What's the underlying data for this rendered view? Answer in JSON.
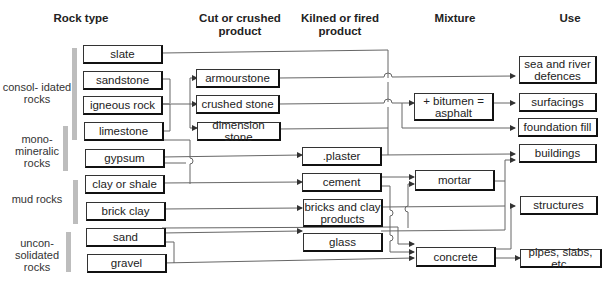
{
  "headers": {
    "rock_type": "Rock type",
    "cut_crushed": "Cut or crushed product",
    "kilned_fired": "Kilned or fired product",
    "mixture": "Mixture",
    "use": "Use"
  },
  "groups": [
    {
      "id": "consolidated",
      "label": "consol- idated rocks"
    },
    {
      "id": "monomineralic",
      "label": "mono- mineralic rocks"
    },
    {
      "id": "mud",
      "label": "mud rocks"
    },
    {
      "id": "unconsolidated",
      "label": "uncon- solidated rocks"
    }
  ],
  "rock_types": [
    {
      "id": "slate",
      "label": "slate"
    },
    {
      "id": "sandstone",
      "label": "sandstone"
    },
    {
      "id": "igneous",
      "label": "igneous rock"
    },
    {
      "id": "limestone",
      "label": "limestone"
    },
    {
      "id": "gypsum",
      "label": "gypsum"
    },
    {
      "id": "clay_shale",
      "label": "clay or shale"
    },
    {
      "id": "brick_clay",
      "label": "brick clay"
    },
    {
      "id": "sand",
      "label": "sand"
    },
    {
      "id": "gravel",
      "label": "gravel"
    }
  ],
  "cut_crushed_products": [
    {
      "id": "armourstone",
      "label": "armourstone"
    },
    {
      "id": "crushed_stone",
      "label": "crushed stone"
    },
    {
      "id": "dimension_stone",
      "label": "dimension stone"
    }
  ],
  "kilned_products": [
    {
      "id": "plaster",
      "label": ".plaster"
    },
    {
      "id": "cement",
      "label": "cement"
    },
    {
      "id": "bricks",
      "label": "bricks and clay products"
    },
    {
      "id": "glass",
      "label": "glass"
    }
  ],
  "mixtures": [
    {
      "id": "asphalt",
      "label": "+ bitumen = asphalt"
    },
    {
      "id": "mortar",
      "label": "mortar"
    },
    {
      "id": "concrete",
      "label": "concrete"
    }
  ],
  "uses": [
    {
      "id": "sea_defences",
      "label": "sea and river defences"
    },
    {
      "id": "surfacings",
      "label": "surfacings"
    },
    {
      "id": "foundation_fill",
      "label": "foundation fill"
    },
    {
      "id": "buildings",
      "label": "buildings"
    },
    {
      "id": "structures",
      "label": "structures"
    },
    {
      "id": "pipes",
      "label": "pipes, slabs, etc."
    }
  ],
  "flows": [
    [
      "slate",
      "buildings"
    ],
    [
      "sandstone",
      "armourstone"
    ],
    [
      "sandstone",
      "dimension_stone"
    ],
    [
      "igneous",
      "crushed_stone"
    ],
    [
      "limestone",
      "dimension_stone"
    ],
    [
      "limestone",
      "cement"
    ],
    [
      "gypsum",
      "plaster"
    ],
    [
      "clay_shale",
      "cement"
    ],
    [
      "brick_clay",
      "bricks"
    ],
    [
      "sand",
      "glass"
    ],
    [
      "sand",
      "mortar"
    ],
    [
      "sand",
      "concrete"
    ],
    [
      "gravel",
      "concrete"
    ],
    [
      "armourstone",
      "sea_defences"
    ],
    [
      "crushed_stone",
      "asphalt"
    ],
    [
      "crushed_stone",
      "foundation_fill"
    ],
    [
      "dimension_stone",
      "buildings"
    ],
    [
      "plaster",
      "buildings"
    ],
    [
      "cement",
      "mortar"
    ],
    [
      "cement",
      "concrete"
    ],
    [
      "bricks",
      "buildings"
    ],
    [
      "glass",
      "buildings"
    ],
    [
      "asphalt",
      "surfacings"
    ],
    [
      "mortar",
      "buildings"
    ],
    [
      "concrete",
      "structures"
    ],
    [
      "concrete",
      "pipes"
    ]
  ],
  "colors": {
    "line": "#555555",
    "box_border": "#222222",
    "group_bar": "#bdbdbd"
  }
}
